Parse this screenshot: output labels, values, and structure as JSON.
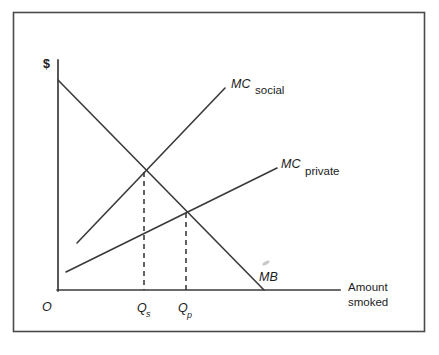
{
  "figure": {
    "type": "economics-externality-diagram",
    "title_fragment_above_box": "",
    "frame": {
      "x": 13,
      "y": 12,
      "width": 412,
      "height": 320,
      "border_color": "#4a4a4a"
    },
    "axes": {
      "y_axis_label": "$",
      "origin_label": "O",
      "x_axis_caption_line1": "Amount",
      "x_axis_caption_line2": "smoked",
      "x_axis": {
        "x1": 58,
        "y1": 290,
        "x2": 340,
        "y2": 290
      },
      "y_axis": {
        "x1": 58,
        "y1": 60,
        "x2": 58,
        "y2": 290
      }
    },
    "curves": [
      {
        "id": "mc-social",
        "name_italic": "MC",
        "name_plain": "social",
        "x1": 77,
        "y1": 243,
        "x2": 225,
        "y2": 88,
        "label_italic_x": 231,
        "label_italic_y": 88,
        "label_plain_x": 255,
        "label_plain_y": 93
      },
      {
        "id": "mc-private",
        "name_italic": "MC",
        "name_plain": "private",
        "x1": 66,
        "y1": 272,
        "x2": 277,
        "y2": 168,
        "label_italic_x": 281,
        "label_italic_y": 168,
        "label_plain_x": 305,
        "label_plain_y": 174
      },
      {
        "id": "marginal-benefit",
        "name_italic": "MB",
        "name_plain": "",
        "x1": 58,
        "y1": 80,
        "x2": 264,
        "y2": 290,
        "label_italic_x": 259,
        "label_italic_y": 281,
        "label_plain_x": 0,
        "label_plain_y": 0
      }
    ],
    "equilibria": [
      {
        "id": "social-optimum",
        "label_main": "Q",
        "label_sub": "s",
        "x": 144,
        "y": 172,
        "axis_y": 290,
        "label_x": 137,
        "label_y": 312
      },
      {
        "id": "private-equilibrium",
        "label_main": "Q",
        "label_sub": "p",
        "x": 186,
        "y": 213,
        "axis_y": 290,
        "label_x": 178,
        "label_y": 312
      }
    ]
  }
}
